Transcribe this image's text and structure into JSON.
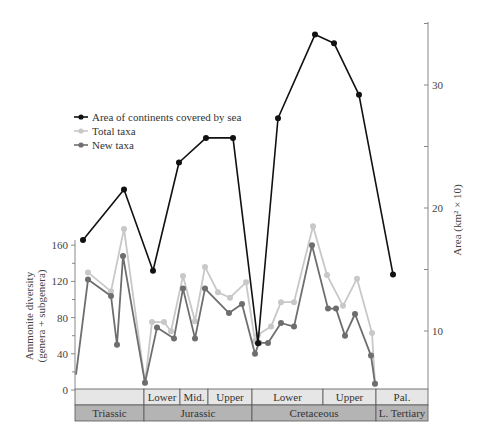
{
  "chart_data": {
    "type": "line",
    "title": "",
    "legend": {
      "position": "upper-left",
      "entries": [
        "Area of continents covered by sea",
        "Total taxa",
        "New taxa"
      ]
    },
    "left_axis": {
      "label_line1": "Ammonite diversity",
      "label_line2": "(genera + subgenera)",
      "ticks": [
        0,
        40,
        80,
        120,
        160
      ],
      "range": [
        0,
        160
      ]
    },
    "right_axis": {
      "label": "Area (km² × 10)",
      "ticks": [
        10,
        20,
        30
      ],
      "minor_ticks": [
        15,
        25,
        35
      ],
      "range": [
        5,
        36
      ]
    },
    "grid": false,
    "series": [
      {
        "name": "Area of continents covered by sea",
        "axis": "right",
        "color": "#111111",
        "points": [
          {
            "x": 83,
            "y": 17.4
          },
          {
            "x": 124,
            "y": 21.5
          },
          {
            "x": 153,
            "y": 14.9
          },
          {
            "x": 179,
            "y": 23.7
          },
          {
            "x": 206,
            "y": 25.7
          },
          {
            "x": 233,
            "y": 25.7
          },
          {
            "x": 258,
            "y": 9.0
          },
          {
            "x": 278,
            "y": 27.3
          },
          {
            "x": 315,
            "y": 34.1
          },
          {
            "x": 334,
            "y": 33.4
          },
          {
            "x": 359,
            "y": 29.2
          },
          {
            "x": 393,
            "y": 14.6
          }
        ]
      },
      {
        "name": "Total taxa",
        "axis": "left",
        "color": "#c8c8c8",
        "points": [
          {
            "x": 88,
            "y": 130
          },
          {
            "x": 111,
            "y": 109
          },
          {
            "x": 124,
            "y": 178
          },
          {
            "x": 145,
            "y": 8
          },
          {
            "x": 152,
            "y": 75
          },
          {
            "x": 164,
            "y": 75
          },
          {
            "x": 171,
            "y": 65
          },
          {
            "x": 183,
            "y": 126
          },
          {
            "x": 195,
            "y": 76
          },
          {
            "x": 205,
            "y": 136
          },
          {
            "x": 218,
            "y": 108
          },
          {
            "x": 230,
            "y": 102
          },
          {
            "x": 246,
            "y": 119
          },
          {
            "x": 255,
            "y": 54
          },
          {
            "x": 258,
            "y": 61
          },
          {
            "x": 271,
            "y": 70
          },
          {
            "x": 281,
            "y": 97
          },
          {
            "x": 294,
            "y": 97
          },
          {
            "x": 313,
            "y": 181
          },
          {
            "x": 327,
            "y": 127
          },
          {
            "x": 343,
            "y": 93
          },
          {
            "x": 357,
            "y": 123
          },
          {
            "x": 372,
            "y": 63
          },
          {
            "x": 375,
            "y": 7
          }
        ]
      },
      {
        "name": "New taxa",
        "axis": "left",
        "color": "#6e6e6e",
        "points": [
          {
            "x": 76,
            "y": 17
          },
          {
            "x": 88,
            "y": 122
          },
          {
            "x": 111,
            "y": 104
          },
          {
            "x": 117,
            "y": 50
          },
          {
            "x": 123,
            "y": 148
          },
          {
            "x": 145,
            "y": 8
          },
          {
            "x": 157,
            "y": 69
          },
          {
            "x": 174,
            "y": 57
          },
          {
            "x": 183,
            "y": 112
          },
          {
            "x": 195,
            "y": 57
          },
          {
            "x": 205,
            "y": 112
          },
          {
            "x": 229,
            "y": 85
          },
          {
            "x": 242,
            "y": 95
          },
          {
            "x": 255,
            "y": 40
          },
          {
            "x": 259,
            "y": 52
          },
          {
            "x": 268,
            "y": 52
          },
          {
            "x": 281,
            "y": 74
          },
          {
            "x": 294,
            "y": 70
          },
          {
            "x": 312,
            "y": 160
          },
          {
            "x": 328,
            "y": 90
          },
          {
            "x": 336,
            "y": 90
          },
          {
            "x": 345,
            "y": 60
          },
          {
            "x": 355,
            "y": 84
          },
          {
            "x": 371,
            "y": 38
          },
          {
            "x": 375,
            "y": 7
          }
        ]
      }
    ],
    "time_bands": {
      "upper_row": [
        {
          "label": "",
          "x0": 75,
          "x1": 144
        },
        {
          "label": "Lower",
          "x0": 144,
          "x1": 180
        },
        {
          "label": "Mid.",
          "x0": 180,
          "x1": 208
        },
        {
          "label": "Upper",
          "x0": 208,
          "x1": 252
        },
        {
          "label": "Lower",
          "x0": 252,
          "x1": 323
        },
        {
          "label": "Upper",
          "x0": 323,
          "x1": 376
        },
        {
          "label": "Pal.",
          "x0": 376,
          "x1": 428
        }
      ],
      "lower_row": [
        {
          "label": "Triassic",
          "x0": 75,
          "x1": 144
        },
        {
          "label": "Jurassic",
          "x0": 144,
          "x1": 252
        },
        {
          "label": "Cretaceous",
          "x0": 252,
          "x1": 376
        },
        {
          "label": "L. Tertiary",
          "x0": 376,
          "x1": 428
        }
      ]
    },
    "colors": {
      "upper_band": "#e6e6e6",
      "lower_band": "#b4b4b4",
      "axis": "#888888"
    }
  }
}
